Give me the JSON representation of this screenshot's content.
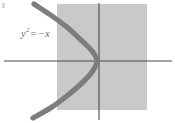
{
  "figure": {
    "type": "math-graph",
    "width": 175,
    "height": 123,
    "background_color": "#ffffff"
  },
  "label": {
    "name": "curve-equation-label",
    "full_text": "y² = −x",
    "variable": "y",
    "exponent": "2",
    "operator": "=",
    "right_side": "−x",
    "color": "#6e6e6e",
    "x": 21,
    "y": 27
  },
  "shaded_region": {
    "name": "shaded-rectangle",
    "fill_color": "#c9c9c9",
    "x": 57,
    "y": 4,
    "width": 90,
    "height": 106
  },
  "axes": {
    "color": "#4a4a4a",
    "stroke_width": 1.1,
    "x_axis": {
      "name": "x-axis",
      "y": 61,
      "x_start": 4,
      "x_end": 172
    },
    "y_axis": {
      "name": "y-axis",
      "x": 99,
      "y_start": 3,
      "y_end": 120
    },
    "origin": {
      "x": 99,
      "y": 61
    }
  },
  "curve": {
    "name": "parabola-curve",
    "equation": "y^2 = -x",
    "color": "#7d7d7d",
    "stroke_width": 5.2,
    "opens": "left",
    "vertex": {
      "x": 97,
      "y": 61
    },
    "points": [
      {
        "x": 34,
        "y": 4
      },
      {
        "x": 52,
        "y": 16
      },
      {
        "x": 68,
        "y": 28
      },
      {
        "x": 82,
        "y": 41
      },
      {
        "x": 92,
        "y": 51
      },
      {
        "x": 97,
        "y": 61
      },
      {
        "x": 92,
        "y": 72
      },
      {
        "x": 82,
        "y": 83
      },
      {
        "x": 68,
        "y": 95
      },
      {
        "x": 52,
        "y": 107
      },
      {
        "x": 33,
        "y": 118
      }
    ]
  },
  "corner_mark": {
    "name": "corner-tick-mark",
    "color": "#d8d8d8",
    "x": 2,
    "y": 3
  },
  "chart_data": {
    "type": "line",
    "xlabel": "",
    "ylabel": "",
    "grid": false,
    "legend": "none",
    "annotations": [
      "y² = −x"
    ],
    "series": [
      {
        "name": "y^2 = -x",
        "x": [
          -13.0,
          -9.6,
          -6.4,
          -3.6,
          -1.6,
          -0.4,
          0.0,
          -0.4,
          -1.6,
          -3.6,
          -6.4,
          -9.6,
          -13.0
        ],
        "y": [
          3.6,
          3.1,
          2.5,
          1.9,
          1.3,
          0.6,
          0.0,
          -0.6,
          -1.3,
          -1.9,
          -2.5,
          -3.1,
          -3.6
        ]
      }
    ],
    "shaded_region": {
      "name": "shaded-rectangle",
      "xlim": [
        -8.4,
        9.6
      ],
      "ylim": [
        -5.1,
        5.8
      ],
      "color": "#c9c9c9"
    },
    "xlim": [
      -19.8,
      15.4
    ],
    "ylim": [
      -6.3,
      6.3
    ]
  }
}
